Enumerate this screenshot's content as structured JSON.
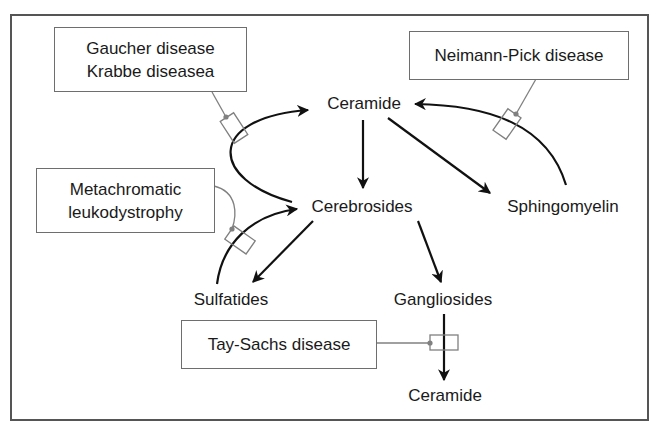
{
  "diagram": {
    "type": "metabolic-pathway",
    "nodes": {
      "ceramide_top": "Ceramide",
      "cerebrosides": "Cerebrosides",
      "sphingomyelin": "Sphingomyelin",
      "sulfatides": "Sulfatides",
      "gangliosides": "Gangliosides",
      "ceramide_bottom": "Ceramide"
    },
    "diseases": {
      "gaucher_krabbe": {
        "line1": "Gaucher disease",
        "line2": "Krabbe diseasea"
      },
      "neimann_pick": {
        "line1": "Neimann-Pick disease"
      },
      "metachromatic": {
        "line1": "Metachromatic",
        "line2": "leukodystrophy"
      },
      "tay_sachs": {
        "line1": "Tay-Sachs disease"
      }
    },
    "edges": [
      {
        "from": "Ceramide",
        "to": "Cerebrosides"
      },
      {
        "from": "Ceramide",
        "to": "Sphingomyelin"
      },
      {
        "from": "Sphingomyelin",
        "to": "Ceramide",
        "blocked_by": "Neimann-Pick disease"
      },
      {
        "from": "Cerebrosides",
        "to": "Ceramide",
        "blocked_by": "Gaucher disease / Krabbe diseasea"
      },
      {
        "from": "Cerebrosides",
        "to": "Sulfatides"
      },
      {
        "from": "Sulfatides",
        "to": "Cerebrosides",
        "blocked_by": "Metachromatic leukodystrophy"
      },
      {
        "from": "Cerebrosides",
        "to": "Gangliosides"
      },
      {
        "from": "Gangliosides",
        "to": "Ceramide",
        "blocked_by": "Tay-Sachs disease"
      }
    ],
    "colors": {
      "arrow": "#111111",
      "connector": "#808080",
      "frame": "#555555",
      "box_border": "#6e6e6e"
    }
  }
}
